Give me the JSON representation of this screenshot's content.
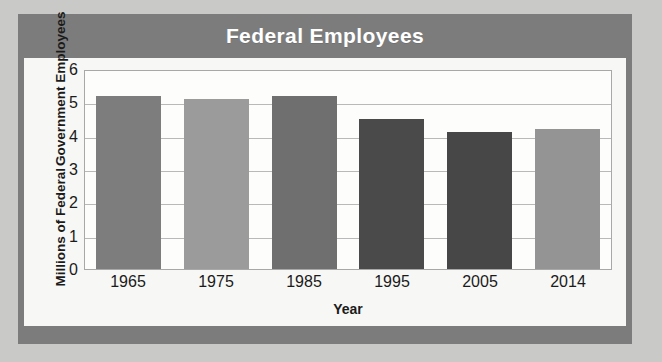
{
  "figure": {
    "background_color": "#c9c9c7",
    "frame_color": "#7c7c7c",
    "card_color": "#f7f7f5"
  },
  "chart_data": {
    "type": "bar",
    "title": "Federal Employees",
    "xlabel": "Year",
    "ylabel_line1": "Millions of Federal",
    "ylabel_line2": "Government Employees",
    "ylabel": "Millions of Federal Government Employees",
    "categories": [
      "1965",
      "1975",
      "1985",
      "1995",
      "2005",
      "2014"
    ],
    "values": [
      5.2,
      5.1,
      5.2,
      4.5,
      4.1,
      4.2
    ],
    "ylim": [
      0,
      6
    ],
    "yticks": [
      "0",
      "1",
      "2",
      "3",
      "4",
      "5",
      "6"
    ],
    "ytick_values": [
      0,
      1,
      2,
      3,
      4,
      5,
      6
    ],
    "grid": true,
    "legend": "none",
    "bar_colors": [
      "#7d7d7d",
      "#9b9b9b",
      "#6f6f6f",
      "#4a4a4a",
      "#474747",
      "#949494"
    ]
  }
}
